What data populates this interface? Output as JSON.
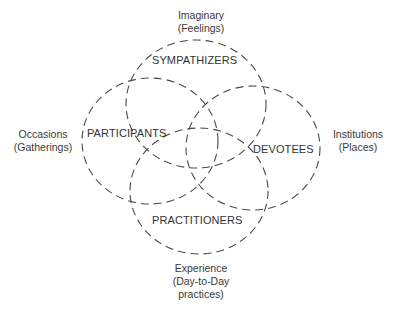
{
  "diagram": {
    "type": "venn",
    "stroke_color": "#4a4a4a",
    "circles": [
      {
        "name": "sympathizers",
        "label": "SYMPATHIZERS",
        "cx": 196,
        "cy": 104,
        "rx": 70,
        "ry": 64
      },
      {
        "name": "participants",
        "label": "PARTICIPANTS",
        "cx": 150,
        "cy": 141,
        "rx": 68,
        "ry": 63
      },
      {
        "name": "devotees",
        "label": "DEVOTEES",
        "cx": 253,
        "cy": 148,
        "rx": 67,
        "ry": 62
      },
      {
        "name": "practitioners",
        "label": "PRACTITIONERS",
        "cx": 199,
        "cy": 191,
        "rx": 69,
        "ry": 63
      }
    ],
    "outer_labels": {
      "top": {
        "line1": "Imaginary",
        "line2": "(Feelings)"
      },
      "left": {
        "line1": "Occasions",
        "line2": "(Gatherings)"
      },
      "right": {
        "line1": "Institutions",
        "line2": "(Places)"
      },
      "bottom": {
        "line1": "Experience",
        "line2": "(Day-to-Day",
        "line3": "practices)"
      }
    }
  }
}
